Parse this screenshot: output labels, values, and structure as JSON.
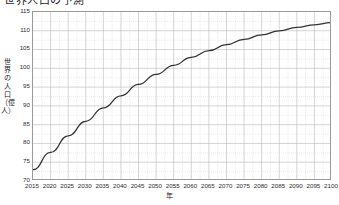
{
  "chart_data": {
    "type": "line",
    "title": "世界人口の予測",
    "xlabel": "年",
    "ylabel": "世界の人口（億人）",
    "xlim": [
      2015,
      2100
    ],
    "ylim": [
      70,
      115
    ],
    "grid": true,
    "minor_grid": true,
    "legend": false,
    "line_color": "#333333",
    "x": [
      2015,
      2020,
      2025,
      2030,
      2035,
      2040,
      2045,
      2050,
      2055,
      2060,
      2065,
      2070,
      2075,
      2080,
      2085,
      2090,
      2095,
      2100
    ],
    "categories": [
      "2015",
      "2020",
      "2025",
      "2030",
      "2035",
      "2040",
      "2045",
      "2050",
      "2055",
      "2060",
      "2065",
      "2070",
      "2075",
      "2080",
      "2085",
      "2090",
      "2095",
      "2100"
    ],
    "values": [
      73.0,
      77.6,
      82.0,
      85.9,
      89.5,
      92.7,
      95.7,
      98.4,
      100.8,
      102.9,
      104.7,
      106.3,
      107.7,
      108.9,
      110.0,
      110.9,
      111.6,
      112.2
    ],
    "series": [
      {
        "name": "世界の人口",
        "values": [
          73.0,
          77.6,
          82.0,
          85.9,
          89.5,
          92.7,
          95.7,
          98.4,
          100.8,
          102.9,
          104.7,
          106.3,
          107.7,
          108.9,
          110.0,
          110.9,
          111.6,
          112.2
        ]
      }
    ],
    "yticks": [
      70,
      75,
      80,
      85,
      90,
      95,
      100,
      105,
      110,
      115
    ],
    "ytick_labels": [
      "70",
      "75",
      "80",
      "85",
      "90",
      "95",
      "100",
      "105",
      "110",
      "115"
    ],
    "xticks": [
      2015,
      2020,
      2025,
      2030,
      2035,
      2040,
      2045,
      2050,
      2055,
      2060,
      2065,
      2070,
      2075,
      2080,
      2085,
      2090,
      2095,
      2100
    ],
    "xtick_labels": [
      "2015",
      "2020",
      "2025",
      "2030",
      "2035",
      "2040",
      "2045",
      "2050",
      "2055",
      "2060",
      "2065",
      "2070",
      "2075",
      "2080",
      "2085",
      "2090",
      "2095",
      "2100"
    ]
  },
  "colors": {
    "line": "#333333",
    "major_grid": "#b9b9b9",
    "minor_grid": "#d8d8d8",
    "axis_border": "#9a9a9a",
    "text": "#2b2b2b",
    "background": "#ffffff"
  }
}
